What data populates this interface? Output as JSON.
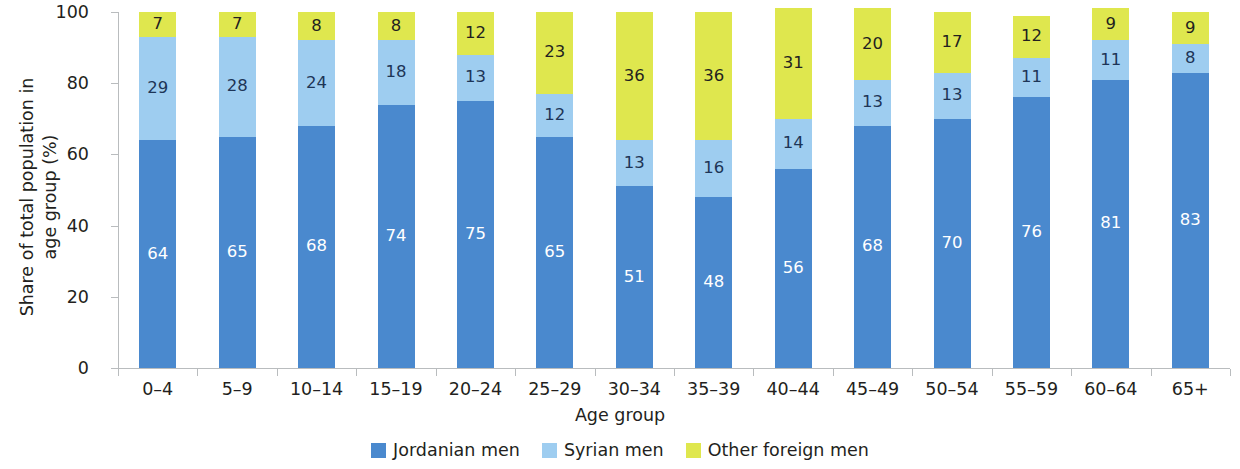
{
  "chart_data": {
    "type": "bar",
    "stacked": true,
    "stack_total": 100,
    "title": "",
    "xlabel": "Age group",
    "ylabel": "Share of total population in\nage group (%)",
    "ylim": [
      0,
      100
    ],
    "yticks": [
      0,
      20,
      40,
      60,
      80,
      100
    ],
    "ytick_labels": [
      "0",
      "20",
      "40",
      "60",
      "80",
      "100"
    ],
    "grid": false,
    "legend_position": "bottom-center",
    "categories": [
      "0–4",
      "5–9",
      "10–14",
      "15–19",
      "20–24",
      "25–29",
      "30–34",
      "35–39",
      "40–44",
      "45–49",
      "50–54",
      "55–59",
      "60–64",
      "65+"
    ],
    "series": [
      {
        "name": "Jordanian men",
        "color": "#4a89ce",
        "label_color": "#ffffff",
        "values": [
          64,
          65,
          68,
          74,
          75,
          65,
          51,
          48,
          56,
          68,
          70,
          76,
          81,
          83
        ]
      },
      {
        "name": "Syrian men",
        "color": "#9ecdf0",
        "label_color": "#1d3557",
        "values": [
          29,
          28,
          24,
          18,
          13,
          12,
          13,
          16,
          14,
          13,
          13,
          11,
          11,
          8
        ]
      },
      {
        "name": "Other foreign men",
        "color": "#dfe74e",
        "label_color": "#231f20",
        "values": [
          7,
          7,
          8,
          8,
          12,
          23,
          36,
          36,
          31,
          20,
          17,
          12,
          9,
          9
        ]
      }
    ]
  },
  "legend": {
    "items": [
      {
        "label": "Jordanian men",
        "color": "#4a89ce"
      },
      {
        "label": "Syrian men",
        "color": "#9ecdf0"
      },
      {
        "label": "Other foreign men",
        "color": "#dfe74e"
      }
    ]
  },
  "axis": {
    "x_title": "Age group",
    "y_title": "Share of total population in\nage group (%)"
  },
  "colors": {
    "jordanian": "#4a89ce",
    "syrian": "#9ecdf0",
    "other_foreign": "#dfe74e",
    "axis": "#b9bcbe",
    "text": "#231f20"
  }
}
